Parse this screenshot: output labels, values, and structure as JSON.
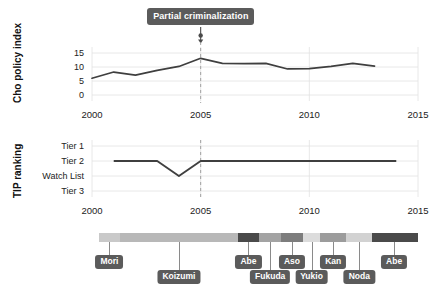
{
  "annotation": {
    "label": "Partial criminalization",
    "year": 2005
  },
  "chart_data": [
    {
      "type": "line",
      "title": "",
      "ylabel": "Cho policy index",
      "xlabel": "",
      "xlim": [
        2000,
        2015
      ],
      "ylim": [
        0,
        16.5
      ],
      "yticks": [
        0,
        5,
        10,
        15
      ],
      "ytick_labels": [
        "0",
        "5",
        "10",
        "15"
      ],
      "xticks": [
        2000,
        2005,
        2010,
        2015
      ],
      "xtick_labels": [
        "2000",
        "2005",
        "2010",
        "2015"
      ],
      "grid": true,
      "line_color": "#3f3f3f",
      "x": [
        2000,
        2001,
        2002,
        2003,
        2004,
        2005,
        2006,
        2007,
        2008,
        2009,
        2010,
        2011,
        2012,
        2013
      ],
      "values": [
        6.0,
        8.2,
        7.1,
        8.8,
        10.2,
        13.1,
        11.3,
        11.2,
        11.3,
        9.3,
        9.4,
        10.2,
        11.3,
        10.3
      ],
      "annotation_line_year": 2005
    },
    {
      "type": "line",
      "title": "",
      "ylabel": "TIP ranking",
      "xlabel": "",
      "xlim": [
        2000,
        2015
      ],
      "yticks": [
        4,
        3,
        2,
        1
      ],
      "ytick_labels": [
        "Tier 1",
        "Tier 2",
        "Watch List",
        "Tier 3"
      ],
      "xticks": [
        2000,
        2005,
        2010,
        2015
      ],
      "xtick_labels": [
        "2000",
        "2005",
        "2010",
        "2015"
      ],
      "grid": true,
      "line_color": "#3f3f3f",
      "x": [
        2001,
        2002,
        2003,
        2004,
        2005,
        2006,
        2007,
        2008,
        2009,
        2010,
        2011,
        2012,
        2013,
        2014
      ],
      "values": [
        3,
        3,
        3,
        2,
        3,
        3,
        3,
        3,
        3,
        3,
        3,
        3,
        3,
        3
      ],
      "annotation_line_year": 2005
    }
  ],
  "pm_timeline": {
    "xlim": [
      2000,
      2015
    ],
    "segments": [
      {
        "name": "Mori",
        "start": 2000.3,
        "end": 2001.3,
        "color": "#c9c9c9"
      },
      {
        "name": "Koizumi",
        "start": 2001.3,
        "end": 2006.7,
        "color": "#b8b8b8"
      },
      {
        "name": "Abe",
        "start": 2006.7,
        "end": 2007.7,
        "color": "#4a4a4a"
      },
      {
        "name": "Fukuda",
        "start": 2007.7,
        "end": 2008.7,
        "color": "#a3a3a3"
      },
      {
        "name": "Aso",
        "start": 2008.7,
        "end": 2009.7,
        "color": "#7d7d7d"
      },
      {
        "name": "Yukio",
        "start": 2009.7,
        "end": 2010.5,
        "color": "#dcdcdc"
      },
      {
        "name": "Kan",
        "start": 2010.5,
        "end": 2011.7,
        "color": "#9c9c9c"
      },
      {
        "name": "Noda",
        "start": 2011.7,
        "end": 2012.9,
        "color": "#d2d2d2"
      },
      {
        "name": "Abe",
        "start": 2012.9,
        "end": 2015.0,
        "color": "#4a4a4a"
      }
    ],
    "labels": [
      {
        "text": "Mori",
        "year": 2000.8,
        "row": 0
      },
      {
        "text": "Koizumi",
        "year": 2004.0,
        "row": 1
      },
      {
        "text": "Abe",
        "year": 2007.2,
        "row": 0
      },
      {
        "text": "Fukuda",
        "year": 2008.2,
        "row": 1
      },
      {
        "text": "Aso",
        "year": 2009.2,
        "row": 0
      },
      {
        "text": "Yukio",
        "year": 2010.1,
        "row": 1
      },
      {
        "text": "Kan",
        "year": 2011.1,
        "row": 0
      },
      {
        "text": "Noda",
        "year": 2012.3,
        "row": 1
      },
      {
        "text": "Abe",
        "year": 2013.9,
        "row": 0
      }
    ]
  }
}
